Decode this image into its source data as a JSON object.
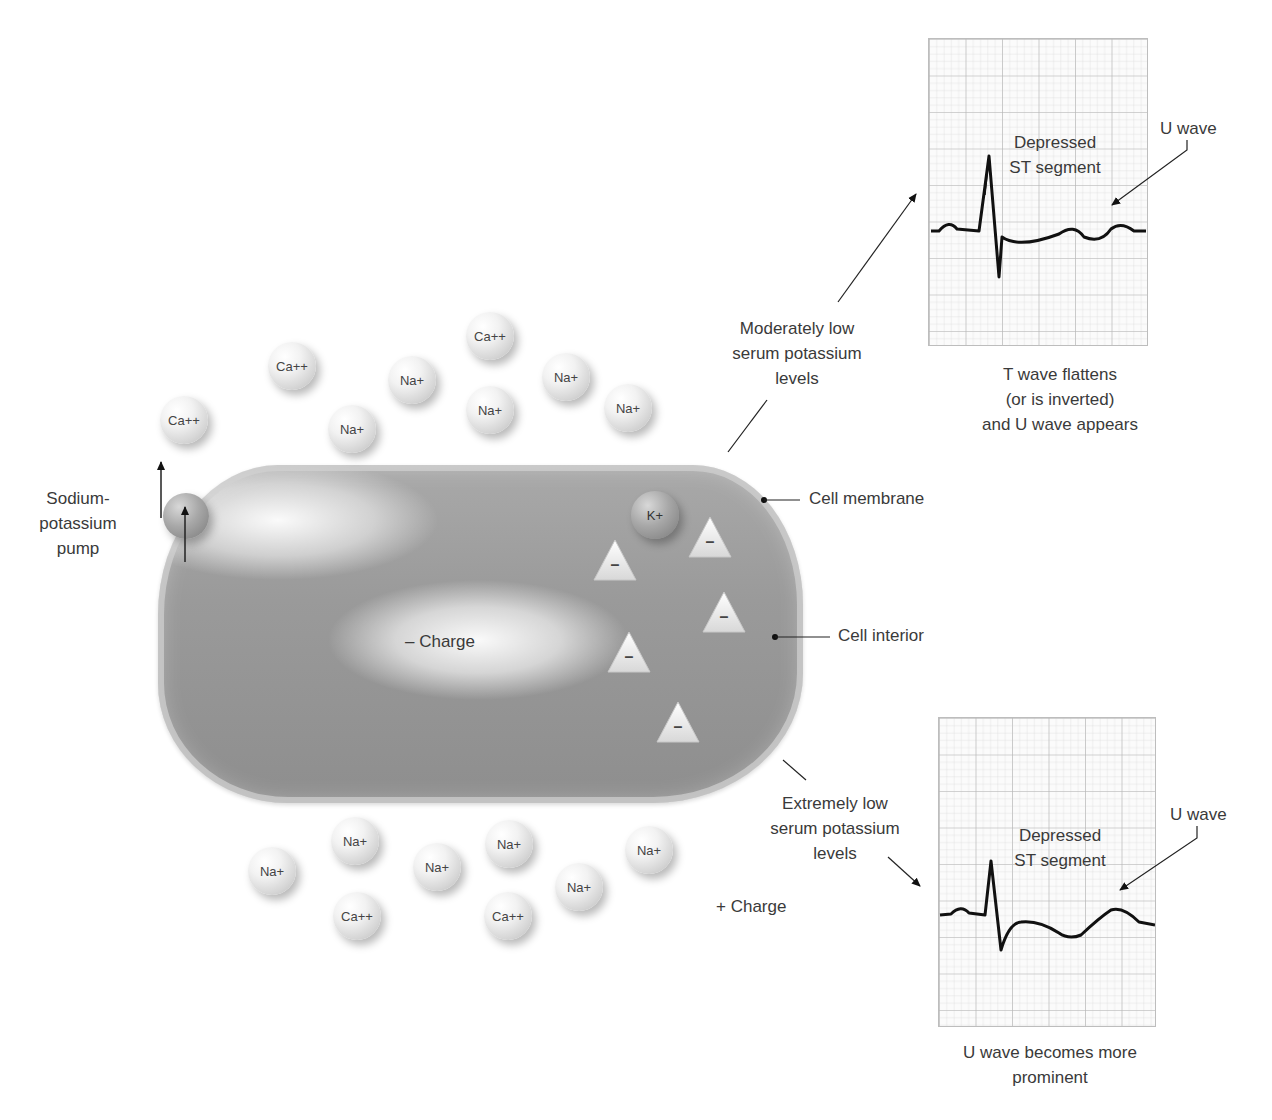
{
  "diagram": {
    "labels": {
      "pump": [
        "Sodium-",
        "potassium",
        "pump"
      ],
      "cell_membrane": "Cell membrane",
      "cell_interior": "Cell interior",
      "neg_charge": "– Charge",
      "pos_charge": "+ Charge",
      "moderate": [
        "Moderately low",
        "serum potassium",
        "levels"
      ],
      "extreme": [
        "Extremely low",
        "serum potassium",
        "levels"
      ]
    },
    "ions_top": [
      {
        "label": "Ca++",
        "x": 160,
        "y": 396
      },
      {
        "label": "Ca++",
        "x": 268,
        "y": 342
      },
      {
        "label": "Na+",
        "x": 328,
        "y": 405
      },
      {
        "label": "Na+",
        "x": 388,
        "y": 356
      },
      {
        "label": "Ca++",
        "x": 466,
        "y": 312
      },
      {
        "label": "Na+",
        "x": 466,
        "y": 386
      },
      {
        "label": "Na+",
        "x": 542,
        "y": 353
      },
      {
        "label": "Na+",
        "x": 604,
        "y": 384
      }
    ],
    "ions_bottom": [
      {
        "label": "Na+",
        "x": 248,
        "y": 847
      },
      {
        "label": "Na+",
        "x": 331,
        "y": 817
      },
      {
        "label": "Ca++",
        "x": 333,
        "y": 892
      },
      {
        "label": "Na+",
        "x": 413,
        "y": 843
      },
      {
        "label": "Na+",
        "x": 485,
        "y": 820
      },
      {
        "label": "Ca++",
        "x": 484,
        "y": 892
      },
      {
        "label": "Na+",
        "x": 555,
        "y": 863
      },
      {
        "label": "Na+",
        "x": 625,
        "y": 826
      }
    ],
    "cell_ions": [
      {
        "label": "K+",
        "x": 631,
        "y": 491
      }
    ],
    "anions": [
      {
        "symbol": "–",
        "x": 592,
        "y": 538
      },
      {
        "symbol": "–",
        "x": 687,
        "y": 515
      },
      {
        "symbol": "–",
        "x": 701,
        "y": 590
      },
      {
        "symbol": "–",
        "x": 606,
        "y": 630
      },
      {
        "symbol": "–",
        "x": 655,
        "y": 700
      }
    ],
    "ecg_top": {
      "annotation_st": [
        "Depressed",
        "ST segment"
      ],
      "annotation_u": "U wave",
      "caption": [
        "T wave flattens",
        "(or is inverted)",
        "and U wave appears"
      ]
    },
    "ecg_bottom": {
      "annotation_st": [
        "Depressed",
        "ST segment"
      ],
      "annotation_u": "U wave",
      "caption": [
        "U wave becomes more",
        "prominent"
      ]
    },
    "colors": {
      "cell": "#9a9a9a",
      "ion": "#e6e6e6",
      "grid_minor": "#dcdcdc",
      "grid_major": "#b4b4b4",
      "trace": "#111111",
      "text": "#3a3a3a"
    }
  }
}
